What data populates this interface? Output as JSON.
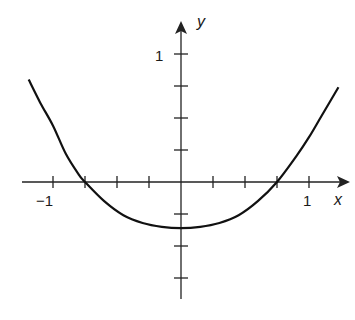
{
  "chart_data": {
    "type": "line",
    "title": "",
    "xlabel": "x",
    "ylabel": "y",
    "xlim": [
      -1.25,
      1.3
    ],
    "ylim": [
      -0.95,
      1.25
    ],
    "grid": false,
    "legend": null,
    "x_ticks": [
      -1,
      -0.75,
      -0.5,
      -0.25,
      0.25,
      0.5,
      0.75,
      1
    ],
    "x_tick_labels": [
      {
        "value": -1,
        "label": "−1"
      },
      {
        "value": 1,
        "label": "1"
      }
    ],
    "y_ticks": [
      1,
      0.75,
      0.5,
      0.25,
      -0.25,
      -0.5,
      -0.75
    ],
    "y_tick_labels": [
      {
        "value": 1,
        "label": "1"
      }
    ],
    "series": [
      {
        "name": "curve",
        "x": [
          -1.19,
          -1.1,
          -1.0,
          -0.9,
          -0.8,
          -0.75,
          -0.6,
          -0.45,
          -0.3,
          -0.15,
          0.0,
          0.15,
          0.3,
          0.45,
          0.6,
          0.75,
          0.9,
          1.0,
          1.1,
          1.23
        ],
        "y": [
          0.8,
          0.62,
          0.44,
          0.22,
          0.06,
          0.0,
          -0.15,
          -0.26,
          -0.32,
          -0.35,
          -0.36,
          -0.35,
          -0.32,
          -0.26,
          -0.15,
          0.0,
          0.2,
          0.35,
          0.52,
          0.74
        ]
      }
    ]
  },
  "axis_labels": {
    "x": "x",
    "y": "y"
  },
  "tick_labels": {
    "x_neg1": "−1",
    "x_pos1": "1",
    "y_pos1": "1"
  }
}
